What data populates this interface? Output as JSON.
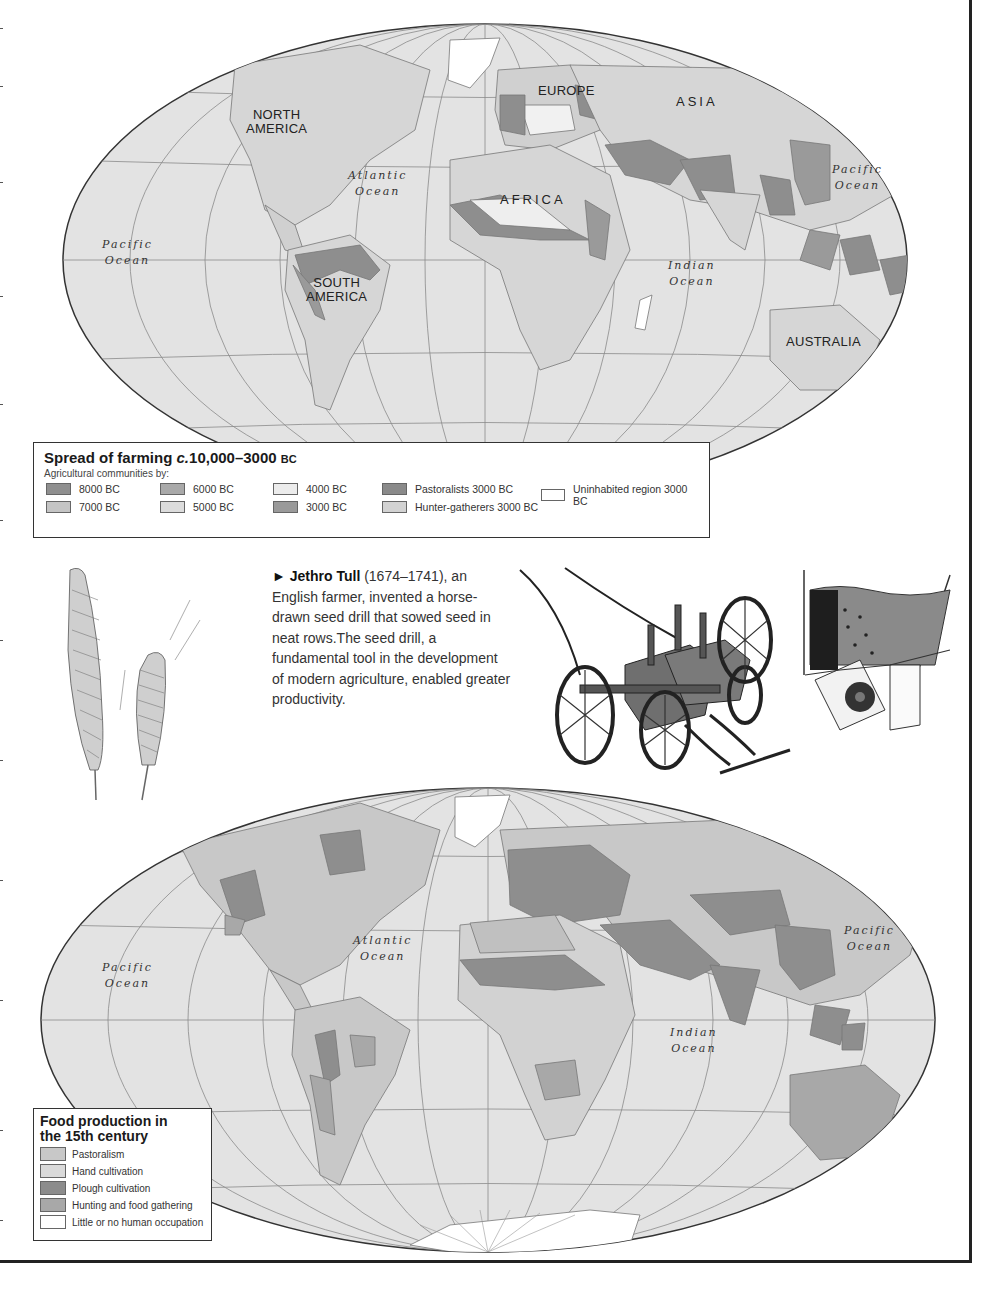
{
  "top_map": {
    "title": "Spread of farming",
    "title_c": "c.",
    "title_range": "10,000–3000",
    "title_era": "BC",
    "subtitle": "Agricultural communities by:",
    "labels": {
      "north_america_1": "NORTH",
      "north_america_2": "AMERICA",
      "europe": "EUROPE",
      "asia": "ASIA",
      "africa": "AFRICA",
      "south_america_1": "SOUTH",
      "south_america_2": "AMERICA",
      "australia": "AUSTRALIA"
    },
    "oceans": {
      "atlantic_1": "Atlantic",
      "atlantic_2": "Ocean",
      "pacific_w_1": "Pacific",
      "pacific_w_2": "Ocean",
      "pacific_e_1": "Pacific",
      "pacific_e_2": "Ocean",
      "indian_1": "Indian",
      "indian_2": "Ocean"
    },
    "legend": [
      {
        "label": "8000 BC",
        "color": "#8f8f8f"
      },
      {
        "label": "7000 BC",
        "color": "#c4c4c4"
      },
      {
        "label": "6000 BC",
        "color": "#a9a9a9"
      },
      {
        "label": "5000 BC",
        "color": "#dcdcdc"
      },
      {
        "label": "4000 BC",
        "color": "#ececec"
      },
      {
        "label": "3000 BC",
        "color": "#9a9a9a"
      },
      {
        "label": "Pastoralists 3000 BC",
        "color": "#8a8a8a"
      },
      {
        "label": "Hunter-gatherers 3000 BC",
        "color": "#d2d2d2"
      },
      {
        "label": "Uninhabited region 3000 BC",
        "color": "#ffffff"
      }
    ]
  },
  "caption": {
    "arrow": "►",
    "name": "Jethro Tull",
    "dates": " (1674–1741),",
    "body": "an English farmer, invented a horse-drawn seed drill that sowed seed in neat rows.The seed drill, a fundamental tool in the development of modern agriculture, enabled greater productivity."
  },
  "illustrations": {
    "wheat": "wheat-ears-drawing",
    "seed_drill": "seed-drill-drawing",
    "seed_mechanism": "seed-drill-mechanism-detail"
  },
  "bottom_map": {
    "title_1": "Food production in",
    "title_2": "the 15th century",
    "oceans": {
      "atlantic_1": "Atlantic",
      "atlantic_2": "Ocean",
      "pacific_w_1": "Pacific",
      "pacific_w_2": "Ocean",
      "pacific_e_1": "Pacific",
      "pacific_e_2": "Ocean",
      "indian_1": "Indian",
      "indian_2": "Ocean"
    },
    "legend": [
      {
        "label": "Pastoralism",
        "color": "#c8c8c8"
      },
      {
        "label": "Hand cultivation",
        "color": "#dadada"
      },
      {
        "label": "Plough cultivation",
        "color": "#8c8c8c"
      },
      {
        "label": "Hunting and food gathering",
        "color": "#a8a8a8"
      },
      {
        "label": "Little or no human occupation",
        "color": "#ffffff"
      }
    ]
  },
  "colors": {
    "ocean": "#e3e3e3",
    "land": "#d0d0d0",
    "dark_region": "#8e8e8e",
    "border": "#222222"
  }
}
